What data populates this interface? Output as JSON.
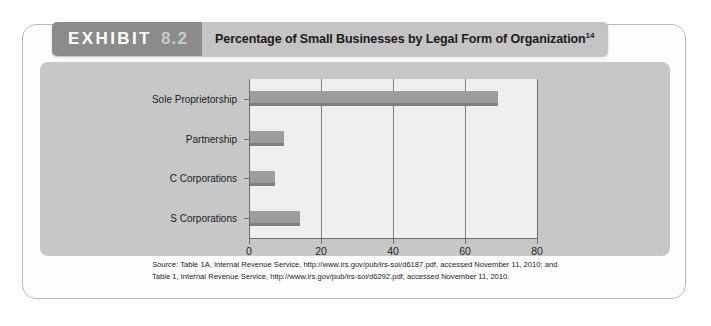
{
  "exhibit": {
    "tag_word": "EXHIBIT",
    "tag_number": "8.2",
    "title": "Percentage of Small Businesses by Legal Form of Organization",
    "title_superscript": "14"
  },
  "source": {
    "label": "Source:",
    "line1": " Table 1A, Internal Revenue Service, http://www.irs.gov/pub/irs-soi/d6187.pdf, accessed November 11, 2010; and",
    "line2": "Table 1, Internal Revenue Service, http://www.irs.gov/pub/irs-soi/d6292.pdf, accessed November 11, 2010."
  },
  "colors": {
    "bar_fill": "#9d9d9d",
    "bar_shadow": "#808080",
    "panel_bg": "#c7c7c7",
    "plot_bg": "#efefef",
    "tag_bg": "#8b8b8b",
    "title_bg": "#c4c4c4"
  },
  "chart_data": {
    "type": "bar",
    "orientation": "horizontal",
    "title": "Percentage of Small Businesses by Legal Form of Organization",
    "categories": [
      "Sole Proprietorship",
      "Partnership",
      "C Corporations",
      "S Corporations"
    ],
    "values": [
      69,
      9.5,
      7,
      14
    ],
    "xlabel": "",
    "ylabel": "",
    "xlim": [
      0,
      80
    ],
    "xticks": [
      0,
      20,
      40,
      60,
      80
    ],
    "xtick_labels": [
      "0",
      "20",
      "40",
      "60",
      "80"
    ],
    "grid": true,
    "legend": false
  }
}
